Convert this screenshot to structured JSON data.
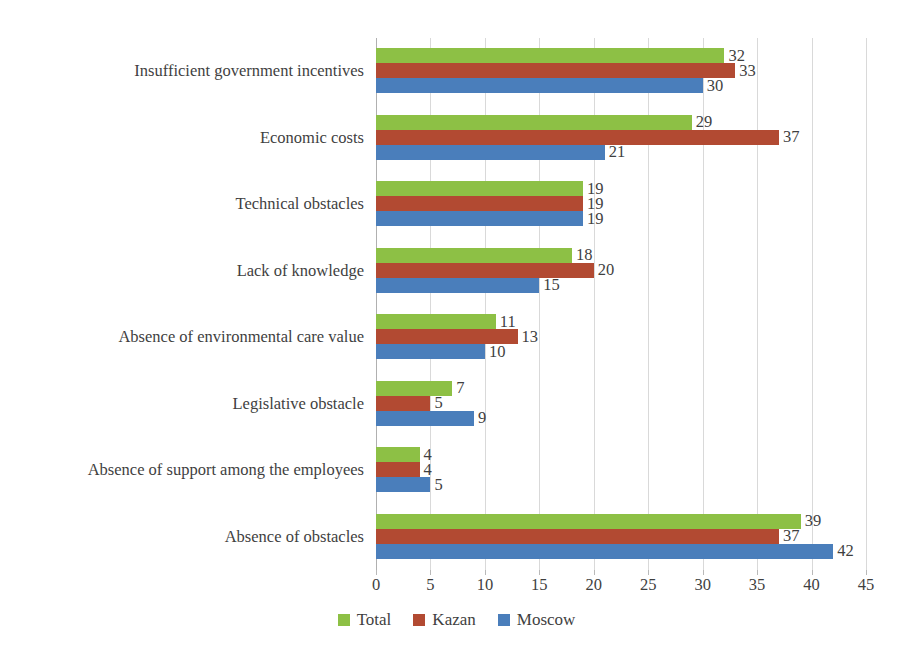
{
  "chart_data": {
    "type": "bar",
    "orientation": "horizontal",
    "title": "",
    "xlabel": "",
    "ylabel": "",
    "xlim": [
      0,
      45
    ],
    "xticks": [
      0,
      5,
      10,
      15,
      20,
      25,
      30,
      35,
      40,
      45
    ],
    "grid": true,
    "legend_position": "bottom",
    "categories": [
      "Insufficient government incentives",
      "Economic costs",
      "Technical obstacles",
      "Lack of knowledge",
      "Absence of environmental care value",
      "Legislative obstacle",
      "Absence of support among the employees",
      "Absence of obstacles"
    ],
    "series": [
      {
        "name": "Total",
        "color": "#8DC045",
        "values": [
          32,
          29,
          19,
          18,
          11,
          7,
          4,
          39
        ]
      },
      {
        "name": "Kazan",
        "color": "#B24A32",
        "values": [
          33,
          37,
          19,
          20,
          13,
          5,
          4,
          37
        ]
      },
      {
        "name": "Moscow",
        "color": "#4A7EBB",
        "values": [
          30,
          21,
          19,
          15,
          10,
          9,
          5,
          42
        ]
      }
    ]
  },
  "legend": {
    "items": [
      {
        "label": "Total",
        "color": "#8DC045"
      },
      {
        "label": "Kazan",
        "color": "#B24A32"
      },
      {
        "label": "Moscow",
        "color": "#4A7EBB"
      }
    ]
  }
}
